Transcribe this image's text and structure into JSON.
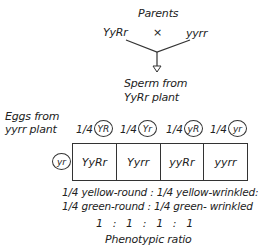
{
  "title": "Parents",
  "parents": {
    "left": "YyRr",
    "cross": "×",
    "right": "yyrr"
  },
  "sperm_label": [
    "Sperm from",
    "YyRr plant"
  ],
  "eggs_label": [
    "Eggs from",
    "yyrr plant"
  ],
  "egg_gamete": "yr",
  "sperm_gametes": [
    {
      "fraction": "1/4",
      "allele": "YR"
    },
    {
      "fraction": "1/4",
      "allele": "Yr"
    },
    {
      "fraction": "1/4",
      "allele": "yR"
    },
    {
      "fraction": "1/4",
      "allele": "yr"
    }
  ],
  "offspring": [
    "YyRr",
    "Yyrr",
    "yyRr",
    "yyrr"
  ],
  "phenotypes": [
    "1/4 yellow-round : 1/4 yellow-wrinkled:",
    "1/4 green-round : 1/4 green- wrinkled"
  ],
  "ratio": "1   :   1   :   1   :   1",
  "ratio_label": "Phenotypic ratio"
}
